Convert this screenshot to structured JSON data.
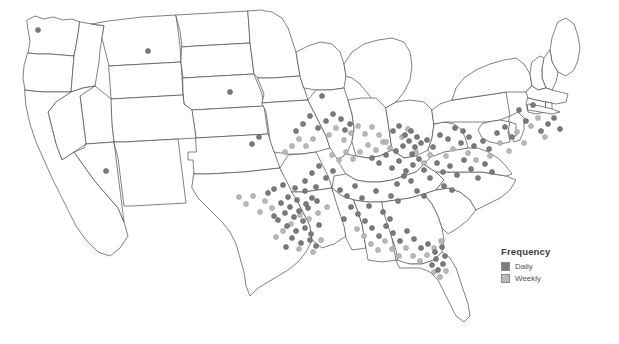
{
  "figure": {
    "type": "dot-density-map",
    "region": "United States (contiguous 48 states)",
    "background_color": "#ffffff",
    "state_outline_color": "#4a4a4a"
  },
  "legend": {
    "title": "Frequency",
    "items": [
      {
        "label": "Daily",
        "color": "#7b7b7b",
        "swatch_name": "legend-swatch-daily"
      },
      {
        "label": "Weekly",
        "color": "#b9b9b9",
        "swatch_name": "legend-swatch-weekly"
      }
    ]
  },
  "chart_data": {
    "type": "scatter",
    "title": "",
    "xlabel": "",
    "ylabel": "",
    "projection": "albers-usa",
    "grid": false,
    "legend_position": "right",
    "series": [
      {
        "name": "Daily",
        "color": "#7b7b7b",
        "marker": "circle",
        "marker_size": 5,
        "points": [
          [
            38,
            30
          ],
          [
            322,
            96
          ],
          [
            350,
            124
          ],
          [
            345,
            130
          ],
          [
            393,
            131
          ],
          [
            399,
            126
          ],
          [
            405,
            135
          ],
          [
            411,
            131
          ],
          [
            417,
            137
          ],
          [
            409,
            141
          ],
          [
            403,
            146
          ],
          [
            396,
            151
          ],
          [
            415,
            147
          ],
          [
            421,
            143
          ],
          [
            412,
            154
          ],
          [
            427,
            140
          ],
          [
            433,
            147
          ],
          [
            440,
            135
          ],
          [
            448,
            139
          ],
          [
            455,
            128
          ],
          [
            463,
            131
          ],
          [
            469,
            137
          ],
          [
            461,
            143
          ],
          [
            474,
            146
          ],
          [
            483,
            141
          ],
          [
            489,
            149
          ],
          [
            497,
            133
          ],
          [
            505,
            127
          ],
          [
            512,
            137
          ],
          [
            519,
            110
          ],
          [
            526,
            121
          ],
          [
            533,
            105
          ],
          [
            541,
            131
          ],
          [
            548,
            124
          ],
          [
            554,
            118
          ],
          [
            560,
            129
          ],
          [
            372,
            158
          ],
          [
            379,
            163
          ],
          [
            386,
            155
          ],
          [
            392,
            168
          ],
          [
            399,
            161
          ],
          [
            406,
            171
          ],
          [
            413,
            165
          ],
          [
            419,
            159
          ],
          [
            404,
            176
          ],
          [
            411,
            181
          ],
          [
            397,
            184
          ],
          [
            424,
            170
          ],
          [
            430,
            178
          ],
          [
            437,
            163
          ],
          [
            443,
            172
          ],
          [
            450,
            166
          ],
          [
            457,
            175
          ],
          [
            464,
            160
          ],
          [
            471,
            169
          ],
          [
            478,
            178
          ],
          [
            485,
            164
          ],
          [
            492,
            172
          ],
          [
            444,
            186
          ],
          [
            452,
            190
          ],
          [
            417,
            191
          ],
          [
            424,
            196
          ],
          [
            391,
            196
          ],
          [
            398,
            201
          ],
          [
            106,
            171
          ],
          [
            148,
            51
          ],
          [
            274,
            189
          ],
          [
            283,
            185
          ],
          [
            295,
            188
          ],
          [
            305,
            191
          ],
          [
            316,
            187
          ],
          [
            288,
            197
          ],
          [
            297,
            200
          ],
          [
            306,
            204
          ],
          [
            312,
            198
          ],
          [
            281,
            203
          ],
          [
            290,
            207
          ],
          [
            299,
            211
          ],
          [
            308,
            208
          ],
          [
            317,
            201
          ],
          [
            285,
            213
          ],
          [
            294,
            217
          ],
          [
            303,
            221
          ],
          [
            278,
            220
          ],
          [
            287,
            226
          ],
          [
            296,
            231
          ],
          [
            305,
            228
          ],
          [
            311,
            234
          ],
          [
            319,
            225
          ],
          [
            292,
            238
          ],
          [
            301,
            243
          ],
          [
            286,
            247
          ],
          [
            310,
            240
          ],
          [
            316,
            246
          ],
          [
            274,
            216
          ],
          [
            268,
            193
          ],
          [
            340,
            190
          ],
          [
            347,
            196
          ],
          [
            355,
            186
          ],
          [
            362,
            198
          ],
          [
            369,
            206
          ],
          [
            376,
            191
          ],
          [
            383,
            212
          ],
          [
            390,
            219
          ],
          [
            351,
            207
          ],
          [
            358,
            214
          ],
          [
            365,
            221
          ],
          [
            344,
            219
          ],
          [
            372,
            228
          ],
          [
            379,
            236
          ],
          [
            386,
            226
          ],
          [
            393,
            233
          ],
          [
            400,
            241
          ],
          [
            407,
            231
          ],
          [
            414,
            239
          ],
          [
            421,
            248
          ],
          [
            428,
            244
          ],
          [
            435,
            252
          ],
          [
            442,
            247
          ],
          [
            436,
            259
          ],
          [
            443,
            264
          ],
          [
            438,
            270
          ],
          [
            445,
            256
          ],
          [
            432,
            265
          ],
          [
            326,
            121
          ],
          [
            333,
            114
          ],
          [
            318,
            128
          ],
          [
            341,
            119
          ],
          [
            310,
            116
          ],
          [
            303,
            124
          ],
          [
            296,
            131
          ],
          [
            333,
            171
          ],
          [
            326,
            178
          ],
          [
            319,
            166
          ],
          [
            312,
            173
          ],
          [
            305,
            181
          ],
          [
            259,
            137
          ],
          [
            252,
            144
          ],
          [
            230,
            92
          ]
        ]
      },
      {
        "name": "Weekly",
        "color": "#b9b9b9",
        "marker": "circle",
        "marker_size": 5,
        "points": [
          [
            402,
            137
          ],
          [
            408,
            129
          ],
          [
            416,
            152
          ],
          [
            424,
            163
          ],
          [
            430,
            155
          ],
          [
            446,
            156
          ],
          [
            453,
            149
          ],
          [
            468,
            153
          ],
          [
            476,
            160
          ],
          [
            490,
            156
          ],
          [
            500,
            143
          ],
          [
            509,
            151
          ],
          [
            517,
            132
          ],
          [
            524,
            143
          ],
          [
            531,
            126
          ],
          [
            538,
            118
          ],
          [
            545,
            137
          ],
          [
            383,
            142
          ],
          [
            390,
            148
          ],
          [
            376,
            150
          ],
          [
            368,
            145
          ],
          [
            360,
            152
          ],
          [
            353,
            159
          ],
          [
            346,
            152
          ],
          [
            339,
            160
          ],
          [
            332,
            155
          ],
          [
            300,
            215
          ],
          [
            309,
            219
          ],
          [
            318,
            213
          ],
          [
            327,
            207
          ],
          [
            283,
            231
          ],
          [
            291,
            224
          ],
          [
            276,
            237
          ],
          [
            299,
            249
          ],
          [
            313,
            252
          ],
          [
            321,
            240
          ],
          [
            357,
            229
          ],
          [
            364,
            236
          ],
          [
            371,
            244
          ],
          [
            378,
            250
          ],
          [
            385,
            241
          ],
          [
            392,
            249
          ],
          [
            399,
            256
          ],
          [
            406,
            248
          ],
          [
            413,
            256
          ],
          [
            420,
            261
          ],
          [
            427,
            255
          ],
          [
            434,
            248
          ],
          [
            441,
            241
          ],
          [
            440,
            277
          ],
          [
            434,
            272
          ],
          [
            446,
            271
          ],
          [
            336,
            128
          ],
          [
            329,
            135
          ],
          [
            344,
            140
          ],
          [
            351,
            133
          ],
          [
            358,
            126
          ],
          [
            365,
            134
          ],
          [
            372,
            127
          ],
          [
            379,
            135
          ],
          [
            386,
            142
          ],
          [
            313,
            139
          ],
          [
            306,
            146
          ],
          [
            299,
            139
          ],
          [
            292,
            146
          ],
          [
            285,
            152
          ],
          [
            265,
            201
          ],
          [
            272,
            208
          ],
          [
            260,
            212
          ],
          [
            253,
            196
          ],
          [
            246,
            204
          ],
          [
            239,
            197
          ]
        ]
      }
    ]
  }
}
